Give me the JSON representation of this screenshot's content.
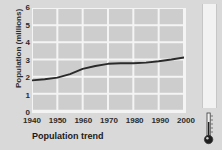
{
  "chart_data": {
    "type": "line",
    "title": "",
    "xlabel": "Population trend",
    "ylabel": "Population (millions)",
    "xlim": [
      1940,
      2000
    ],
    "ylim": [
      0,
      6
    ],
    "grid": true,
    "legend": false,
    "x_ticks": [
      "1940",
      "1950",
      "1960",
      "1970",
      "1980",
      "1990",
      "2000"
    ],
    "y_ticks": [
      "0",
      "1",
      "2",
      "3",
      "4",
      "5",
      "6"
    ],
    "series": [
      {
        "name": "Population",
        "color": "#2a2a2a",
        "x": [
          1940,
          1945,
          1950,
          1955,
          1960,
          1965,
          1970,
          1975,
          1980,
          1985,
          1990,
          1995,
          2000
        ],
        "values": [
          1.78,
          1.85,
          1.94,
          2.15,
          2.45,
          2.62,
          2.75,
          2.78,
          2.78,
          2.82,
          2.9,
          3.0,
          3.12
        ]
      }
    ]
  },
  "axis": {
    "ylabel": "Population (millions)",
    "xlabel": "Population trend",
    "y_ticks": [
      "6",
      "5",
      "4",
      "3",
      "2",
      "1",
      "0"
    ],
    "x_ticks": [
      "1940",
      "1950",
      "1960",
      "1970",
      "1980",
      "1990",
      "2000"
    ]
  },
  "colors": {
    "page_background": "#d9d9d9",
    "plot_background": "#cdcdcd",
    "gridline": "#f4f4f4",
    "line": "#2a2a2a",
    "text": "#2b2b2b",
    "scroll_track": "#f2f2f2"
  },
  "sidebar": {
    "scrollbar_name": "vertical-scrollbar",
    "tool_name": "thermometer"
  }
}
